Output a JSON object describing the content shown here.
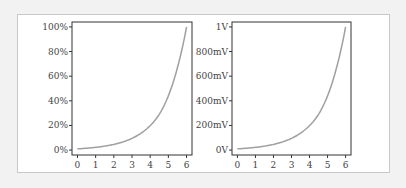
{
  "chart_data": [
    {
      "type": "line",
      "title": "",
      "xlabel": "",
      "ylabel": "",
      "x": [
        0,
        0.5,
        1,
        1.5,
        2,
        2.5,
        3,
        3.5,
        4,
        4.5,
        5,
        5.5,
        6
      ],
      "series": [
        {
          "name": "",
          "values": [
            0.01,
            0.015,
            0.022,
            0.032,
            0.046,
            0.066,
            0.095,
            0.137,
            0.198,
            0.29,
            0.44,
            0.67,
            1.0
          ]
        }
      ],
      "xticks": [
        "0",
        "1",
        "2",
        "3",
        "4",
        "5",
        "6"
      ],
      "yticks": [
        "0%",
        "20%",
        "40%",
        "60%",
        "80%",
        "100%"
      ],
      "xlim": [
        -0.3,
        6.3
      ],
      "ylim": [
        -0.04,
        1.04
      ],
      "grid": false,
      "line_color": "#a0a0a0"
    },
    {
      "type": "line",
      "title": "",
      "xlabel": "",
      "ylabel": "",
      "x": [
        0,
        0.5,
        1,
        1.5,
        2,
        2.5,
        3,
        3.5,
        4,
        4.5,
        5,
        5.5,
        6
      ],
      "series": [
        {
          "name": "",
          "values": [
            0.01,
            0.015,
            0.022,
            0.032,
            0.046,
            0.066,
            0.095,
            0.137,
            0.198,
            0.29,
            0.44,
            0.67,
            1.0
          ]
        }
      ],
      "xticks": [
        "0",
        "1",
        "2",
        "3",
        "4",
        "5",
        "6"
      ],
      "yticks": [
        "0V",
        "200mV",
        "400mV",
        "600mV",
        "800mV",
        "1V"
      ],
      "xlim": [
        -0.3,
        6.3
      ],
      "ylim": [
        -0.04,
        1.04
      ],
      "grid": false,
      "line_color": "#a0a0a0"
    }
  ]
}
